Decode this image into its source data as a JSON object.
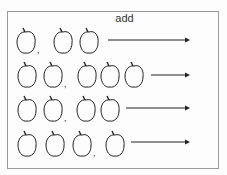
{
  "worksheet": {
    "title": "add",
    "rows": [
      {
        "groups": [
          1,
          2
        ],
        "apples_x": [
          17,
          54,
          80
        ],
        "comma_after": [
          0
        ],
        "y": 28,
        "arrow": {
          "x1": 108,
          "x2": 190,
          "y": 40
        }
      },
      {
        "groups": [
          2,
          3
        ],
        "apples_x": [
          18,
          44,
          78,
          101,
          125
        ],
        "comma_after": [
          1
        ],
        "y": 62,
        "arrow": {
          "x1": 151,
          "x2": 190,
          "y": 75
        }
      },
      {
        "groups": [
          2,
          2
        ],
        "apples_x": [
          18,
          44,
          77,
          101
        ],
        "comma_after": [
          1
        ],
        "y": 96,
        "arrow": {
          "x1": 126,
          "x2": 190,
          "y": 108
        }
      },
      {
        "groups": [
          3,
          1
        ],
        "apples_x": [
          18,
          46,
          73,
          106
        ],
        "comma_after": [
          2
        ],
        "y": 131,
        "arrow": {
          "x1": 131,
          "x2": 190,
          "y": 142
        }
      }
    ],
    "icon": "apple-icon",
    "stroke_color": "#222222",
    "border_color": "#9a9a9a"
  }
}
